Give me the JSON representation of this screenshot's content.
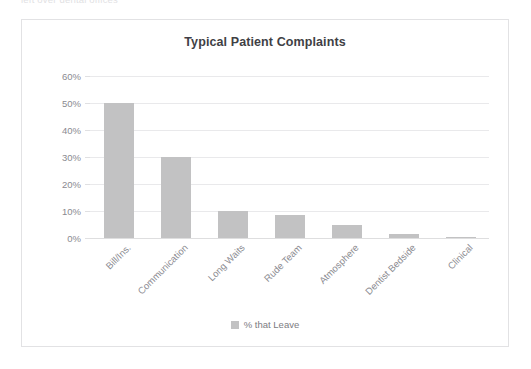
{
  "clipped_header_text": "left over dental offices",
  "card": {
    "title": "Typical Patient Complaints",
    "border_color": "#e2e2e4",
    "background_color": "#ffffff"
  },
  "legend": {
    "position": "bottom-center",
    "entries": [
      {
        "label": "% that Leave",
        "color": "#c2c2c3"
      }
    ]
  },
  "axis": {
    "y_ticks": [
      "0%",
      "10%",
      "20%",
      "30%",
      "40%",
      "50%",
      "60%"
    ],
    "y_min": 0,
    "y_max": 60,
    "y_step": 10,
    "tick_color": "#8a8a90",
    "grid_color": "#e9e9eb"
  },
  "chart_data": {
    "type": "bar",
    "title": "Typical Patient Complaints",
    "xlabel": "",
    "ylabel": "",
    "ylim": [
      0,
      60
    ],
    "ytick_suffix": "%",
    "yticks": [
      0,
      10,
      20,
      30,
      40,
      50,
      60
    ],
    "grid": true,
    "legend_position": "bottom",
    "bar_color": "#c2c2c3",
    "categories": [
      "Bill/Ins.",
      "Communication",
      "Long Waits",
      "Rude Team",
      "Atmosphere",
      "Dentist Bedside",
      "Clinical"
    ],
    "series": [
      {
        "name": "% that Leave",
        "values": [
          50,
          30,
          10,
          8.5,
          5,
          1.5,
          0.5
        ]
      }
    ]
  }
}
